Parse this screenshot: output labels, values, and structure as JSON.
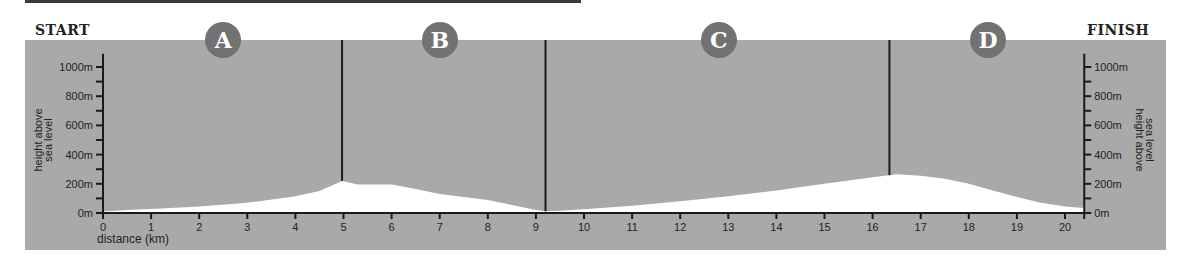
{
  "labels": {
    "start": "START",
    "finish": "FINISH",
    "xlabel": "distance (km)",
    "ylabel_line1": "height above",
    "ylabel_line2": "sea level"
  },
  "sections": [
    {
      "label": "A",
      "center_km": 2.5
    },
    {
      "label": "B",
      "center_km": 7.0
    },
    {
      "label": "C",
      "center_km": 12.8
    },
    {
      "label": "D",
      "center_km": 18.4
    }
  ],
  "colors": {
    "panel": "#a9a9a9",
    "profile": "#ffffff",
    "badge": "#727272",
    "axis": "#1a1a1a"
  },
  "chart_data": {
    "type": "area",
    "title": "",
    "xlabel": "distance (km)",
    "ylabel": "height above sea level",
    "xlim": [
      0,
      20.4
    ],
    "ylim": [
      0,
      1050
    ],
    "x_ticks": [
      0,
      1,
      2,
      3,
      4,
      5,
      6,
      7,
      8,
      9,
      10,
      11,
      12,
      13,
      14,
      15,
      16,
      17,
      18,
      19,
      20
    ],
    "y_ticks": [
      0,
      200,
      400,
      600,
      800,
      1000
    ],
    "y_tick_labels": [
      "0m",
      "200m",
      "400m",
      "600m",
      "800m",
      "1000m"
    ],
    "y_minor_step": 100,
    "section_dividers_km": [
      4.97,
      9.2,
      16.35
    ],
    "section_labels": [
      "A",
      "B",
      "C",
      "D"
    ],
    "series": [
      {
        "name": "elevation",
        "x": [
          0,
          0.5,
          1,
          2,
          3,
          4,
          4.5,
          4.97,
          5.3,
          6,
          6.5,
          7,
          8,
          8.5,
          9,
          9.2,
          9.5,
          10,
          11,
          12,
          13,
          14,
          15,
          16,
          16.5,
          17,
          17.5,
          18,
          18.5,
          19,
          19.5,
          20,
          20.4
        ],
        "values": [
          10,
          20,
          28,
          45,
          70,
          115,
          150,
          220,
          195,
          195,
          165,
          130,
          90,
          55,
          20,
          12,
          15,
          25,
          50,
          80,
          115,
          155,
          200,
          245,
          265,
          255,
          235,
          200,
          155,
          110,
          70,
          45,
          35
        ]
      }
    ]
  }
}
